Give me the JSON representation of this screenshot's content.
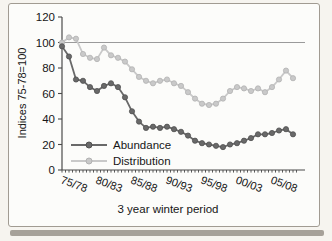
{
  "figure": {
    "frame_color": "#a19b92",
    "background": "#fcfcfa",
    "axis_color": "#4a4a4a",
    "reference_line_color": "#8f8f8f"
  },
  "chart_data": {
    "type": "line",
    "title": "",
    "xlabel": "3 year winter period",
    "ylabel": "Indices 75-78=100",
    "ylim": [
      0,
      120
    ],
    "yticks": [
      0,
      20,
      40,
      60,
      80,
      100,
      120
    ],
    "xtick_labels": [
      "75/78",
      "80/83",
      "85/88",
      "90/93",
      "95/98",
      "00/03",
      "05/08"
    ],
    "xtick_label_interval": 5,
    "reference_line": 100,
    "grid": "off",
    "legend_position": "inside-bottom-left",
    "categories": [
      "75/78",
      "76/79",
      "77/80",
      "78/81",
      "79/82",
      "80/83",
      "81/84",
      "82/85",
      "83/86",
      "84/87",
      "85/88",
      "86/89",
      "87/90",
      "88/91",
      "89/92",
      "90/93",
      "91/94",
      "92/95",
      "93/96",
      "94/97",
      "95/98",
      "96/99",
      "97/00",
      "98/01",
      "99/02",
      "00/03",
      "01/04",
      "02/05",
      "03/06",
      "04/07",
      "05/08",
      "06/09",
      "07/10",
      "08/11"
    ],
    "series": [
      {
        "name": "Abundance",
        "color": "#696969",
        "edge_color": "#515151",
        "values": [
          97,
          89,
          71,
          70,
          65,
          62,
          66,
          68,
          65,
          57,
          46,
          38,
          33,
          34,
          33,
          34,
          32,
          30,
          27,
          23,
          21,
          20,
          19,
          18,
          20,
          21,
          23,
          25,
          28,
          28,
          29,
          31,
          32,
          28
        ]
      },
      {
        "name": "Distribution",
        "color": "#c9c9c9",
        "edge_color": "#b2b2b2",
        "values": [
          100,
          104,
          103,
          91,
          88,
          87,
          96,
          90,
          88,
          85,
          79,
          73,
          70,
          68,
          70,
          71,
          68,
          66,
          61,
          56,
          52,
          51,
          52,
          56,
          62,
          65,
          64,
          62,
          64,
          61,
          65,
          71,
          78,
          72
        ]
      }
    ]
  }
}
